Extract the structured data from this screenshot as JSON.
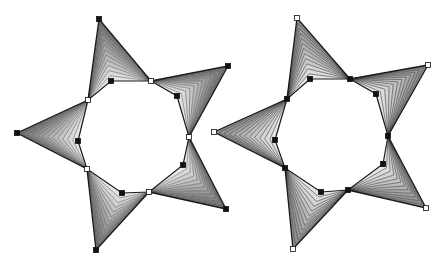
{
  "figure": {
    "width": 445,
    "height": 266,
    "background": "#ffffff",
    "blend_steps": 12,
    "colors": {
      "outline": "#1a1a1a",
      "blend_line": "#3a3a3a",
      "node_fill_closed": "#111111",
      "node_fill_open": "#ffffff",
      "node_stroke": "#111111"
    }
  },
  "stars": [
    {
      "name": "left-star",
      "style": "dense-blend",
      "fill_outer": "#6e6e6e",
      "fill_inner": "#f0f0f0",
      "inner_polygon": [
        [
          111,
          81
        ],
        [
          177,
          96
        ],
        [
          183,
          165
        ],
        [
          122,
          193
        ],
        [
          78,
          141
        ]
      ],
      "arms": [
        {
          "a": [
            88,
            100
          ],
          "tip": [
            99,
            19
          ],
          "b": [
            151,
            81
          ],
          "inner": [
            111,
            81
          ]
        },
        {
          "a": [
            151,
            81
          ],
          "tip": [
            228,
            66
          ],
          "b": [
            189,
            137
          ],
          "inner": [
            177,
            96
          ]
        },
        {
          "a": [
            189,
            137
          ],
          "tip": [
            226,
            209
          ],
          "b": [
            149,
            192
          ],
          "inner": [
            183,
            165
          ]
        },
        {
          "a": [
            149,
            192
          ],
          "tip": [
            96,
            250
          ],
          "b": [
            87,
            169
          ],
          "inner": [
            122,
            193
          ]
        },
        {
          "a": [
            87,
            169
          ],
          "tip": [
            17,
            133
          ],
          "b": [
            88,
            100
          ],
          "inner": [
            78,
            141
          ]
        }
      ],
      "nodes": [
        {
          "x": 99,
          "y": 19,
          "type": "closed"
        },
        {
          "x": 151,
          "y": 81,
          "type": "open"
        },
        {
          "x": 228,
          "y": 66,
          "type": "closed"
        },
        {
          "x": 189,
          "y": 137,
          "type": "open"
        },
        {
          "x": 226,
          "y": 209,
          "type": "closed"
        },
        {
          "x": 149,
          "y": 192,
          "type": "open"
        },
        {
          "x": 96,
          "y": 250,
          "type": "closed"
        },
        {
          "x": 87,
          "y": 169,
          "type": "open"
        },
        {
          "x": 17,
          "y": 133,
          "type": "closed"
        },
        {
          "x": 88,
          "y": 100,
          "type": "open"
        },
        {
          "x": 111,
          "y": 81,
          "type": "closed"
        },
        {
          "x": 177,
          "y": 96,
          "type": "closed"
        },
        {
          "x": 183,
          "y": 165,
          "type": "closed"
        },
        {
          "x": 122,
          "y": 193,
          "type": "closed"
        },
        {
          "x": 78,
          "y": 141,
          "type": "closed"
        }
      ]
    },
    {
      "name": "right-star",
      "style": "sparse-blend",
      "fill_outer": "#8a8a8a",
      "fill_inner": "#ececec",
      "inner_polygon": [
        [
          310,
          79
        ],
        [
          350,
          79
        ],
        [
          376,
          94
        ],
        [
          388,
          136
        ],
        [
          383,
          164
        ],
        [
          348,
          190
        ],
        [
          321,
          192
        ],
        [
          285,
          168
        ],
        [
          275,
          140
        ],
        [
          287,
          99
        ]
      ],
      "arms": [
        {
          "a": [
            287,
            99
          ],
          "tip": [
            297,
            18
          ],
          "b": [
            350,
            79
          ],
          "inner": [
            310,
            79
          ]
        },
        {
          "a": [
            350,
            79
          ],
          "tip": [
            428,
            65
          ],
          "b": [
            388,
            136
          ],
          "inner": [
            376,
            94
          ]
        },
        {
          "a": [
            388,
            136
          ],
          "tip": [
            426,
            208
          ],
          "b": [
            348,
            190
          ],
          "inner": [
            383,
            164
          ]
        },
        {
          "a": [
            348,
            190
          ],
          "tip": [
            293,
            249
          ],
          "b": [
            285,
            168
          ],
          "inner": [
            321,
            192
          ]
        },
        {
          "a": [
            285,
            168
          ],
          "tip": [
            214,
            132
          ],
          "b": [
            287,
            99
          ],
          "inner": [
            275,
            140
          ]
        }
      ],
      "nodes": [
        {
          "x": 297,
          "y": 18,
          "type": "open"
        },
        {
          "x": 428,
          "y": 65,
          "type": "open"
        },
        {
          "x": 426,
          "y": 208,
          "type": "open"
        },
        {
          "x": 293,
          "y": 249,
          "type": "open"
        },
        {
          "x": 214,
          "y": 132,
          "type": "open"
        },
        {
          "x": 310,
          "y": 79,
          "type": "closed"
        },
        {
          "x": 350,
          "y": 79,
          "type": "closed"
        },
        {
          "x": 376,
          "y": 94,
          "type": "closed"
        },
        {
          "x": 388,
          "y": 136,
          "type": "closed"
        },
        {
          "x": 383,
          "y": 164,
          "type": "closed"
        },
        {
          "x": 348,
          "y": 190,
          "type": "closed"
        },
        {
          "x": 321,
          "y": 192,
          "type": "closed"
        },
        {
          "x": 285,
          "y": 168,
          "type": "closed"
        },
        {
          "x": 275,
          "y": 140,
          "type": "closed"
        },
        {
          "x": 287,
          "y": 99,
          "type": "closed"
        }
      ]
    }
  ]
}
